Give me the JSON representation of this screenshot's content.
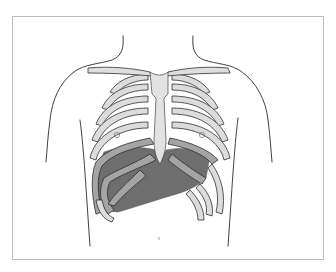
{
  "figure": {
    "colors": {
      "background": "#ffffff",
      "frame_border": "#bdbdbd",
      "rib_fill": "#dcdcdc",
      "rib_outline": "#2f2f2f",
      "liver_fill": "#6e6e6e",
      "rib_over_liver": "#a4a4a4",
      "sternum_fill": "#e2e2e2"
    },
    "labels": {
      "left_marker": "",
      "right_marker": ""
    }
  }
}
